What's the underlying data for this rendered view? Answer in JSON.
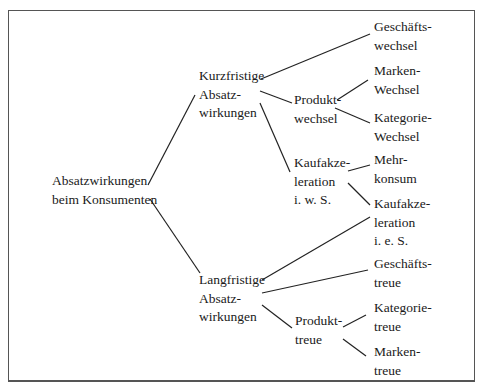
{
  "diagram": {
    "type": "tree",
    "line_color": "#222222",
    "frame_color": "#555555",
    "nodes": {
      "root": {
        "lines": [
          "Absatzwirkungen",
          "beim Konsumenten"
        ]
      },
      "kurz": {
        "lines": [
          "Kurzfristige",
          "Absatz-",
          "wirkungen"
        ]
      },
      "lang": {
        "lines": [
          "Langfristige",
          "Absatz-",
          "wirkungen"
        ]
      },
      "geschaeftswechsel": {
        "lines": [
          "Geschäfts-",
          "wechsel"
        ]
      },
      "produktwechsel": {
        "lines": [
          "Produkt-",
          "wechsel"
        ]
      },
      "markenwechsel": {
        "lines": [
          "Marken-",
          "Wechsel"
        ]
      },
      "kategoriewechsel": {
        "lines": [
          "Kategorie-",
          "Wechsel"
        ]
      },
      "kaufakz_iws": {
        "lines": [
          "Kaufakze-",
          "leration",
          "i. w. S."
        ]
      },
      "mehrkonsum": {
        "lines": [
          "Mehr-",
          "konsum"
        ]
      },
      "kaufakz_ies": {
        "lines": [
          "Kaufakze-",
          "leration",
          "i. e. S."
        ]
      },
      "geschaeftstreue": {
        "lines": [
          "Geschäfts-",
          "treue"
        ]
      },
      "produkttreue": {
        "lines": [
          "Produkt-",
          "treue"
        ]
      },
      "kategorietreue": {
        "lines": [
          "Kategorie-",
          "treue"
        ]
      },
      "markentreue": {
        "lines": [
          "Marken-",
          "treue"
        ]
      }
    },
    "edges": [
      [
        "root",
        "kurz"
      ],
      [
        "root",
        "lang"
      ],
      [
        "kurz",
        "geschaeftswechsel"
      ],
      [
        "kurz",
        "produktwechsel"
      ],
      [
        "kurz",
        "kaufakz_iws"
      ],
      [
        "produktwechsel",
        "markenwechsel"
      ],
      [
        "produktwechsel",
        "kategoriewechsel"
      ],
      [
        "kaufakz_iws",
        "mehrkonsum"
      ],
      [
        "kaufakz_iws",
        "kaufakz_ies"
      ],
      [
        "lang",
        "kaufakz_ies"
      ],
      [
        "lang",
        "geschaeftstreue"
      ],
      [
        "lang",
        "produkttreue"
      ],
      [
        "produkttreue",
        "kategorietreue"
      ],
      [
        "produkttreue",
        "markentreue"
      ]
    ]
  }
}
